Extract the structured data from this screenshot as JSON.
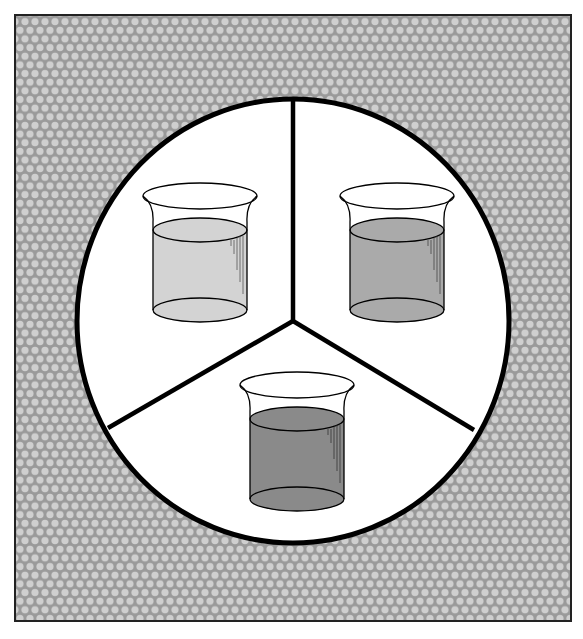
{
  "figure": {
    "background_pattern": "hexagonal-dot-texture",
    "colors": {
      "frame_background": "#9a9a9a",
      "dot_fill": "#cfcfcf",
      "circle_fill": "#ffffff",
      "outline": "#000000",
      "liquid_light": "#d3d3d3",
      "liquid_medium": "#aaaaaa",
      "liquid_dark": "#8a8a8a"
    },
    "sectors": [
      {
        "position": "upper-left",
        "beaker": {
          "liquid_shade": "light",
          "fill_color": "#d3d3d3"
        }
      },
      {
        "position": "upper-right",
        "beaker": {
          "liquid_shade": "medium",
          "fill_color": "#aaaaaa"
        }
      },
      {
        "position": "bottom",
        "beaker": {
          "liquid_shade": "dark",
          "fill_color": "#8a8a8a"
        }
      }
    ]
  }
}
